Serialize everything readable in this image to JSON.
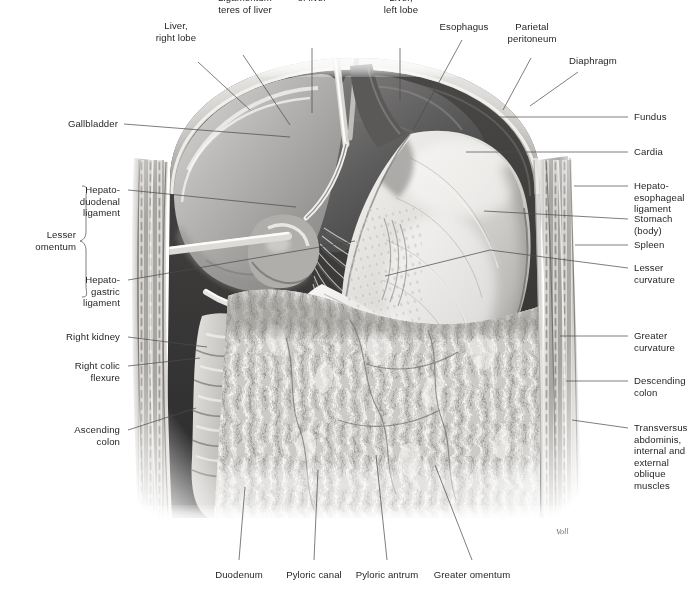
{
  "figure": {
    "signature": "Voll",
    "ink": "#231f20",
    "leader_color": "#4b4b4d"
  },
  "labels": {
    "top": [
      {
        "id": "liver-right-lobe",
        "text": "Liver,\nright lobe"
      },
      {
        "id": "ligamentum-teres",
        "text": "Ligamentum\nteres of liver"
      },
      {
        "id": "falciform-ligament",
        "text": "Falciform ligament\nof liver"
      },
      {
        "id": "liver-left-lobe",
        "text": "Liver,\nleft lobe"
      },
      {
        "id": "esophagus",
        "text": "Esophagus"
      },
      {
        "id": "parietal-peritoneum",
        "text": "Parietal\nperitoneum"
      },
      {
        "id": "diaphragm",
        "text": "Diaphragm"
      }
    ],
    "right": [
      {
        "id": "fundus",
        "text": "Fundus"
      },
      {
        "id": "cardia",
        "text": "Cardia"
      },
      {
        "id": "hepato-esophageal-ligament",
        "text": "Hepato-\nesophageal\nligament"
      },
      {
        "id": "stomach-body",
        "text": "Stomach\n(body)"
      },
      {
        "id": "spleen",
        "text": "Spleen"
      },
      {
        "id": "lesser-curvature",
        "text": "Lesser\ncurvature"
      },
      {
        "id": "greater-curvature",
        "text": "Greater\ncurvature"
      },
      {
        "id": "descending-colon",
        "text": "Descending\ncolon"
      },
      {
        "id": "abdominal-wall-muscles",
        "text": "Transversus\nabdominis,\ninternal and\nexternal\noblique\nmuscles"
      }
    ],
    "left": [
      {
        "id": "gallbladder",
        "text": "Gallbladder"
      },
      {
        "id": "hepatoduodenal-ligament",
        "text": "Hepato-\nduodenal\nligament"
      },
      {
        "id": "lesser-omentum",
        "text": "Lesser\nomentum"
      },
      {
        "id": "hepatogastric-ligament",
        "text": "Hepato-\ngastric\nligament"
      },
      {
        "id": "right-kidney",
        "text": "Right kidney"
      },
      {
        "id": "right-colic-flexure",
        "text": "Right colic\nflexure"
      },
      {
        "id": "ascending-colon",
        "text": "Ascending\ncolon"
      }
    ],
    "bottom": [
      {
        "id": "duodenum",
        "text": "Duodenum"
      },
      {
        "id": "pyloric-canal",
        "text": "Pyloric canal"
      },
      {
        "id": "pyloric-antrum",
        "text": "Pyloric antrum"
      },
      {
        "id": "greater-omentum",
        "text": "Greater omentum"
      }
    ]
  }
}
